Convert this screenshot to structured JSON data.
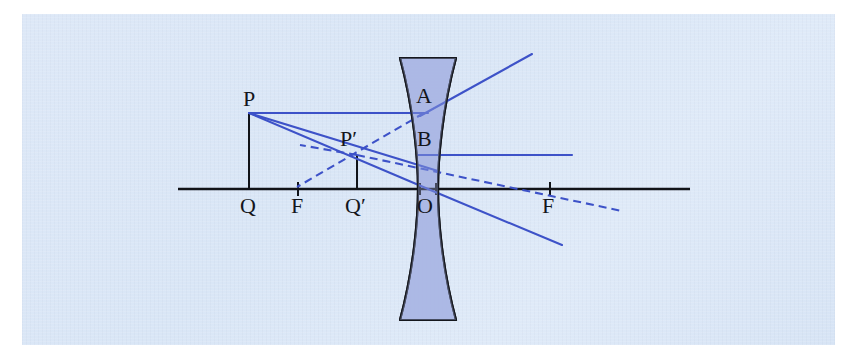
{
  "figure": {
    "background_color": "#dce7f7",
    "axis_color": "#111318",
    "ray_color": "#3d52c8",
    "lens_fill": "#a9b6e4",
    "lens_outline": "#15171d",
    "label_color": "#14161c"
  },
  "labels": [
    {
      "name": "point-p",
      "text": "P",
      "x": 243,
      "y": 88,
      "size": 22
    },
    {
      "name": "point-p-prime",
      "text": "P′",
      "x": 340,
      "y": 128,
      "size": 22
    },
    {
      "name": "point-a",
      "text": "A",
      "x": 416,
      "y": 85,
      "size": 22
    },
    {
      "name": "point-b",
      "text": "B",
      "x": 417,
      "y": 128,
      "size": 22
    },
    {
      "name": "point-q",
      "text": "Q",
      "x": 240,
      "y": 195,
      "size": 22
    },
    {
      "name": "focal-point-left",
      "text": "F",
      "x": 291,
      "y": 195,
      "size": 22
    },
    {
      "name": "point-q-prime",
      "text": "Q′",
      "x": 345,
      "y": 195,
      "size": 22
    },
    {
      "name": "lens-center-o",
      "text": "O",
      "x": 417,
      "y": 195,
      "size": 22
    },
    {
      "name": "focal-point-right",
      "text": "F",
      "x": 542,
      "y": 195,
      "size": 22
    }
  ],
  "geometry": {
    "optical_axis": {
      "x1": 178,
      "y": 189,
      "x2": 690
    },
    "lens": {
      "center_x": 428,
      "top_y": 58,
      "bottom_y": 320,
      "top_half_width": 28,
      "waist_half_width": 10,
      "waist_y": 189
    },
    "axis_ticks": [
      {
        "name": "tick-focal-left",
        "x": 298
      },
      {
        "name": "tick-focal-right",
        "x": 550
      },
      {
        "name": "tick-vertex-left",
        "x": 420
      },
      {
        "name": "tick-vertex-right",
        "x": 436
      }
    ],
    "object_segment": {
      "name": "object-pq",
      "x": 249,
      "y_top": 113,
      "y_bottom": 189
    },
    "image_segment": {
      "name": "image-p-prime-q-prime",
      "x": 357,
      "y_top": 155,
      "y_bottom": 189
    },
    "rays": [
      {
        "name": "incident-ray-parallel",
        "style": "solid",
        "x1": 249,
        "y1": 113,
        "x2": 422,
        "y2": 113
      },
      {
        "name": "refracted-ray-upward",
        "style": "solid",
        "x1": 422,
        "y1": 113,
        "x2": 532,
        "y2": 54
      },
      {
        "name": "virtual-ray-back-to-focus",
        "style": "dashed",
        "x1": 422,
        "y1": 113,
        "x2": 296,
        "y2": 188
      },
      {
        "name": "incident-ray-to-center",
        "style": "solid",
        "x1": 249,
        "y1": 113,
        "x2": 428,
        "y2": 189
      },
      {
        "name": "refracted-ray-through-center",
        "style": "solid",
        "x1": 428,
        "y1": 189,
        "x2": 562,
        "y2": 245
      },
      {
        "name": "incident-ray-to-focus",
        "style": "solid",
        "x1": 249,
        "y1": 113,
        "x2": 434,
        "y2": 168
      },
      {
        "name": "refracted-ray-horizontal",
        "style": "solid",
        "x1": 420,
        "y1": 155,
        "x2": 572,
        "y2": 155
      },
      {
        "name": "virtual-extension-to-right-focus",
        "style": "dashed",
        "x1": 357,
        "y1": 155,
        "x2": 622,
        "y2": 210
      },
      {
        "name": "virtual-extension-left",
        "style": "dashed",
        "x1": 357,
        "y1": 155,
        "x2": 300,
        "y2": 145
      }
    ]
  }
}
